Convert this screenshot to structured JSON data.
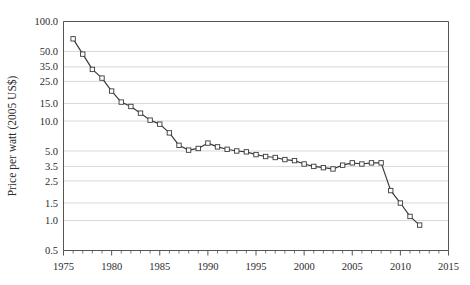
{
  "chart_data": {
    "type": "line",
    "title": "",
    "xlabel": "",
    "ylabel": "Price per watt (2005 US$)",
    "yscale": "log",
    "ylim": [
      0.5,
      100.0
    ],
    "xlim": [
      1975,
      2015
    ],
    "grid": true,
    "legend": false,
    "marker": "open-square",
    "line_color": "#3a3a3a",
    "grid_color": "#cfcfcf",
    "axis_color": "#555555",
    "ytick_labels": [
      "100.0",
      "50.0",
      "35.0",
      "25.0",
      "15.0",
      "10.0",
      "5.0",
      "3.5",
      "2.5",
      "1.5",
      "1.0",
      "0.5"
    ],
    "ytick_values": [
      100.0,
      50.0,
      35.0,
      25.0,
      15.0,
      10.0,
      5.0,
      3.5,
      2.5,
      1.5,
      1.0,
      0.5
    ],
    "xtick_labels": [
      "1975",
      "1980",
      "1985",
      "1990",
      "1995",
      "2000",
      "2005",
      "2010",
      "2015"
    ],
    "xtick_values": [
      1975,
      1980,
      1985,
      1990,
      1995,
      2000,
      2005,
      2010,
      2015
    ],
    "xminor_step": 1,
    "x": [
      1976,
      1977,
      1978,
      1979,
      1980,
      1981,
      1982,
      1983,
      1984,
      1985,
      1986,
      1987,
      1988,
      1989,
      1990,
      1991,
      1992,
      1993,
      1994,
      1995,
      1996,
      1997,
      1998,
      1999,
      2000,
      2001,
      2002,
      2003,
      2004,
      2005,
      2006,
      2007,
      2008,
      2009,
      2010,
      2011,
      2012
    ],
    "values": [
      67.0,
      47.0,
      33.0,
      27.0,
      20.0,
      15.5,
      14.0,
      12.0,
      10.2,
      9.3,
      7.6,
      5.7,
      5.1,
      5.3,
      6.0,
      5.5,
      5.2,
      5.0,
      4.9,
      4.6,
      4.4,
      4.3,
      4.1,
      4.0,
      3.7,
      3.5,
      3.4,
      3.3,
      3.6,
      3.8,
      3.7,
      3.8,
      3.8,
      2.0,
      1.5,
      1.1,
      0.9
    ],
    "series_name": "Crystalline silicon PV module price"
  }
}
